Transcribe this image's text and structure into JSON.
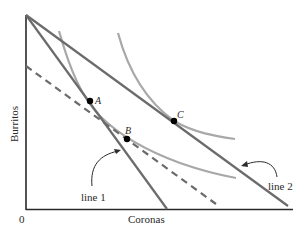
{
  "diagram": {
    "axes": {
      "x_label": "Coronas",
      "y_label": "Burritos",
      "origin_label": "0"
    },
    "points": [
      {
        "id": "A",
        "label": "A"
      },
      {
        "id": "B",
        "label": "B"
      },
      {
        "id": "C",
        "label": "C"
      }
    ],
    "lines": [
      {
        "id": "line1",
        "label": "line 1"
      },
      {
        "id": "line2",
        "label": "line 2"
      }
    ],
    "colors": {
      "axis": "#2a2a2a",
      "budget_line": "#6b6b6b",
      "indifference_curve": "#a8a8a8",
      "dashed_line": "#6b6b6b",
      "point": "#000000"
    }
  }
}
